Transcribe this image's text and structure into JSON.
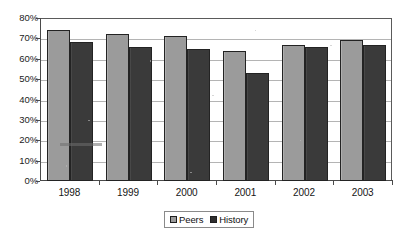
{
  "chart_data": {
    "type": "bar",
    "title": "",
    "subtitle": "",
    "xlabel": "",
    "ylabel": "",
    "categories": [
      "1998",
      "1999",
      "2000",
      "2001",
      "2002",
      "2003"
    ],
    "series": [
      {
        "name": "Peers",
        "color": "#9b9b9b",
        "values": [
          74,
          72,
          71,
          64,
          67,
          69
        ]
      },
      {
        "name": "History",
        "color": "#3a3a3a",
        "values": [
          68,
          66,
          65,
          53,
          66,
          67
        ]
      }
    ],
    "ylim": [
      0,
      80
    ],
    "ytick_step": 10,
    "ytick_labels": [
      "0%",
      "10%",
      "20%",
      "30%",
      "40%",
      "50%",
      "60%",
      "70%",
      "80%"
    ],
    "ytick_values": [
      0,
      10,
      20,
      30,
      40,
      50,
      60,
      70,
      80
    ],
    "grid": true,
    "grid_axis": "y",
    "legend_position": "bottom-center",
    "value_suffix": "%",
    "annotations": []
  },
  "legend": {
    "entries": [
      {
        "label": "Peers",
        "swatch": "legend-swatch-peers"
      },
      {
        "label": "History",
        "swatch": "legend-swatch-history"
      }
    ]
  },
  "colors": {
    "peers": "#9b9b9b",
    "history": "#3a3a3a",
    "gridline": "#b4b4b4",
    "axis": "#4a4a4a",
    "plot_border": "#5a5a5a",
    "background": "#ffffff",
    "text": "#151515"
  }
}
